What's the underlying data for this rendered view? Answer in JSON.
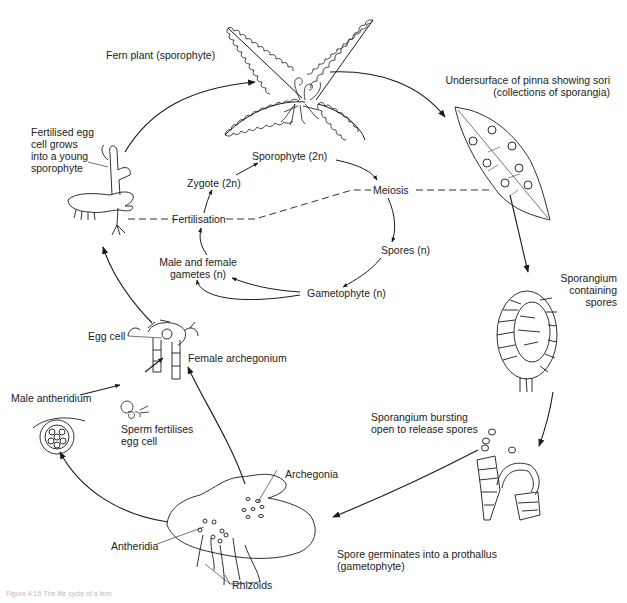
{
  "diagram": {
    "title": "Life cycle of a fern",
    "outer_cycle": {
      "fern_plant": "Fern plant (sporophyte)",
      "pinna": "Undersurface of pinna showing sori\n(collections of sporangia)",
      "sporangium": "Sporangium\ncontaining\nspores",
      "sporangium_bursting": "Sporangium bursting\nopen to release spores",
      "prothallus": "Spore germinates into a prothallus\n(gametophyte)",
      "archegonia": "Archegonia",
      "antheridia": "Antheridia",
      "rhizoids": "Rhizoids",
      "male_antheridium": "Male antheridium",
      "sperm": "Sperm fertilises\negg cell",
      "egg_cell": "Egg cell",
      "female_archegonium": "Female archegonium",
      "young_sporophyte": "Fertilised egg\ncell grows\ninto a young\nsporophyte"
    },
    "inner_cycle": {
      "sporophyte": "Sporophyte (2n)",
      "meiosis": "Meiosis",
      "spores": "Spores (n)",
      "gametophyte": "Gametophyte (n)",
      "gametes": "Male and female\ngametes (n)",
      "fertilisation": "Fertilisation",
      "zygote": "Zygote (2n)"
    },
    "caption": "Figure 4.16 The life cycle of a fern",
    "colors": {
      "ink": "#1a1a1a",
      "background": "#ffffff"
    }
  }
}
